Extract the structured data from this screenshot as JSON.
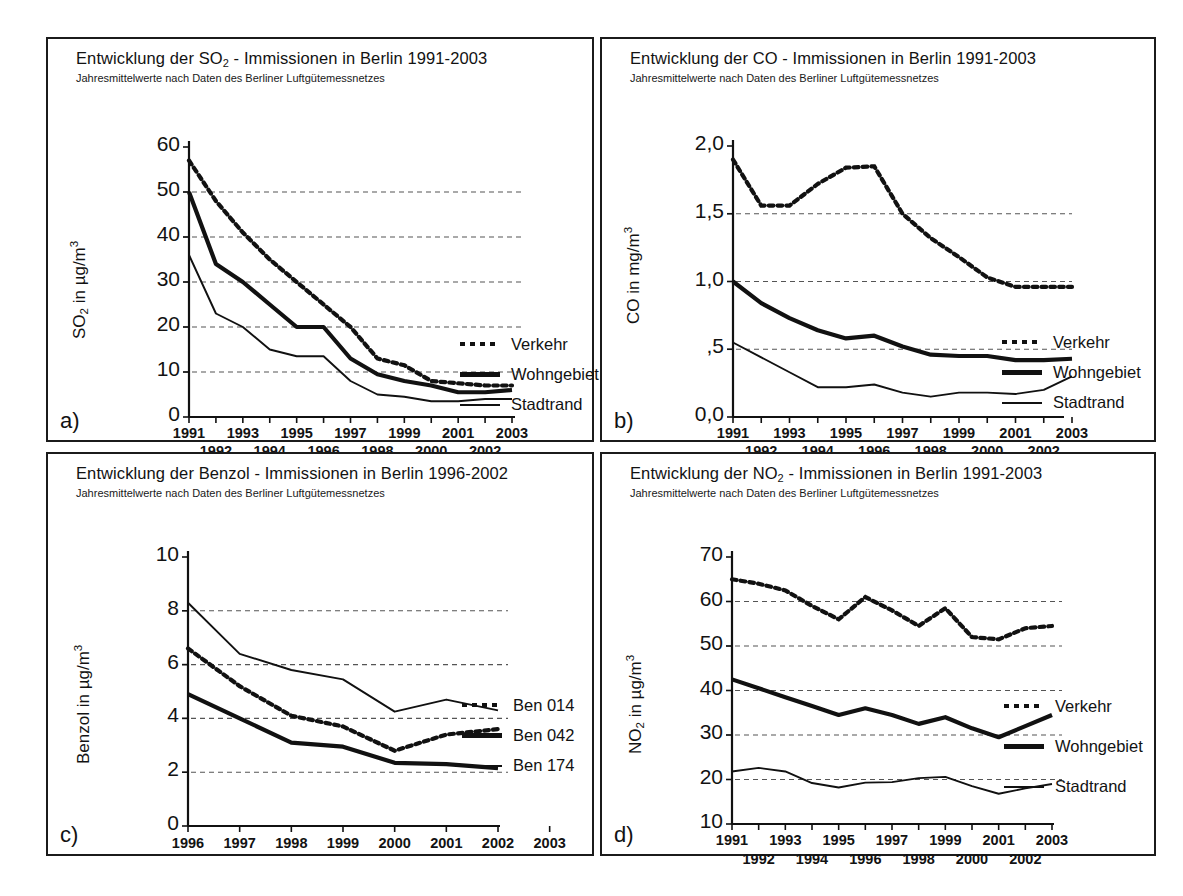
{
  "panels": [
    {
      "key": "a",
      "label": "a)",
      "title_pre": "Entwicklung der SO",
      "title_sub": "2",
      "title_post": " - Immissionen  in Berlin 1991-2003",
      "subtitle": "Jahresmittelwerte nach Daten des Berliner Luftgütemessnetzes",
      "ylabel_pre": "SO",
      "ylabel_sub": "2",
      "ylabel_post": " in µg/m",
      "ylabel_sup": "3",
      "yticks": [
        "0",
        "10",
        "20",
        "30",
        "40",
        "50",
        "60"
      ],
      "xticks_top": [
        "1991",
        "1993",
        "1995",
        "1997",
        "1999",
        "2001",
        "2003"
      ],
      "xticks_bottom": [
        "1992",
        "1994",
        "1996",
        "1998",
        "2000",
        "2002"
      ],
      "legend": [
        {
          "style": "dotted",
          "label": "Verkehr"
        },
        {
          "style": "thick",
          "label": "Wohngebiet"
        },
        {
          "style": "thin",
          "label": "Stadtrand"
        }
      ]
    },
    {
      "key": "b",
      "label": "b)",
      "title_pre": "Entwicklung der CO - Immissionen  in Berlin 1991-2003",
      "title_sub": "",
      "title_post": "",
      "subtitle": "Jahresmittelwerte nach Daten des Berliner Luftgütemessnetzes",
      "ylabel_pre": "CO in mg/m",
      "ylabel_sub": "",
      "ylabel_post": "",
      "ylabel_sup": "3",
      "yticks": [
        "0,0",
        ",5",
        "1,0",
        "1,5",
        "2,0"
      ],
      "xticks_top": [
        "1991",
        "1993",
        "1995",
        "1997",
        "1999",
        "2001",
        "2003"
      ],
      "xticks_bottom": [
        "1992",
        "1994",
        "1996",
        "1998",
        "2000",
        "2002"
      ],
      "legend": [
        {
          "style": "dotted",
          "label": "Verkehr"
        },
        {
          "style": "thick",
          "label": "Wohngebiet"
        },
        {
          "style": "thin",
          "label": "Stadtrand"
        }
      ]
    },
    {
      "key": "c",
      "label": "c)",
      "title_pre": "Entwicklung der Benzol - Immissionen  in Berlin 1996-2002",
      "title_sub": "",
      "title_post": "",
      "subtitle": "Jahresmittelwerte nach Daten des Berliner Luftgütemessnetzes",
      "ylabel_pre": "Benzol in µg/m",
      "ylabel_sub": "",
      "ylabel_post": "",
      "ylabel_sup": "3",
      "yticks": [
        "0",
        "2",
        "4",
        "6",
        "8",
        "10"
      ],
      "xticks_top": [
        "1996",
        "1997",
        "1998",
        "1999",
        "2000",
        "2001",
        "2002",
        "2003"
      ],
      "xticks_bottom": [],
      "legend": [
        {
          "style": "dotted",
          "label": "Ben 014"
        },
        {
          "style": "thick",
          "label": "Ben 042"
        },
        {
          "style": "thin",
          "label": "Ben 174"
        }
      ]
    },
    {
      "key": "d",
      "label": "d)",
      "title_pre": "Entwicklung der NO",
      "title_sub": "2",
      "title_post": " - Immissionen  in Berlin 1991-2003",
      "subtitle": "Jahresmittelwerte nach Daten des Berliner Luftgütemessnetzes",
      "ylabel_pre": "NO",
      "ylabel_sub": "2",
      "ylabel_post": " in µg/m",
      "ylabel_sup": "3",
      "yticks": [
        "10",
        "20",
        "30",
        "40",
        "50",
        "60",
        "70"
      ],
      "xticks_top": [
        "1991",
        "1993",
        "1995",
        "1997",
        "1999",
        "2001",
        "2003"
      ],
      "xticks_bottom": [
        "1992",
        "1994",
        "1996",
        "1998",
        "2000",
        "2002"
      ],
      "legend": [
        {
          "style": "dotted",
          "label": "Verkehr"
        },
        {
          "style": "thick",
          "label": "Wohngebiet"
        },
        {
          "style": "thin",
          "label": "Stadtrand"
        }
      ]
    }
  ],
  "chart_data": [
    {
      "id": "a",
      "type": "line",
      "title": "Entwicklung der SO2 - Immissionen  in Berlin 1991-2003",
      "subtitle": "Jahresmittelwerte nach Daten des Berliner Luftgütemessnetzes",
      "xlabel": "",
      "ylabel": "SO2 in µg/m3",
      "ylim": [
        0,
        60
      ],
      "yticks": [
        0,
        10,
        20,
        30,
        40,
        50,
        60
      ],
      "grid": true,
      "legend_position": "right",
      "x": [
        1991,
        1992,
        1993,
        1994,
        1995,
        1996,
        1997,
        1998,
        1999,
        2000,
        2001,
        2002,
        2003
      ],
      "series": [
        {
          "name": "Verkehr",
          "style": "dotted",
          "values": [
            57,
            48,
            41,
            35,
            30,
            25,
            20,
            13,
            11.5,
            8,
            7.5,
            7,
            7
          ]
        },
        {
          "name": "Wohngebiet",
          "style": "thick",
          "values": [
            50,
            34,
            30,
            25,
            20,
            20,
            13,
            9.5,
            8,
            7,
            5.5,
            5.5,
            6
          ]
        },
        {
          "name": "Stadtrand",
          "style": "thin",
          "values": [
            36,
            23,
            20,
            15,
            13.5,
            13.5,
            8,
            5,
            4.5,
            3.5,
            3.5,
            4,
            4
          ]
        }
      ]
    },
    {
      "id": "b",
      "type": "line",
      "title": "Entwicklung der CO - Immissionen  in Berlin 1991-2003",
      "subtitle": "Jahresmittelwerte nach Daten des Berliner Luftgütemessnetzes",
      "xlabel": "",
      "ylabel": "CO in mg/m3",
      "ylim": [
        0.0,
        2.0
      ],
      "yticks": [
        0.0,
        0.5,
        1.0,
        1.5,
        2.0
      ],
      "grid": true,
      "legend_position": "right",
      "x": [
        1991,
        1992,
        1993,
        1994,
        1995,
        1996,
        1997,
        1998,
        1999,
        2000,
        2001,
        2002,
        2003
      ],
      "series": [
        {
          "name": "Verkehr",
          "style": "dotted",
          "values": [
            1.9,
            1.56,
            1.56,
            1.72,
            1.84,
            1.85,
            1.5,
            1.32,
            1.18,
            1.03,
            0.96,
            0.96,
            0.96
          ]
        },
        {
          "name": "Wohngebiet",
          "style": "thick",
          "values": [
            1.0,
            0.84,
            0.73,
            0.64,
            0.58,
            0.6,
            0.52,
            0.46,
            0.45,
            0.45,
            0.42,
            0.42,
            0.43
          ]
        },
        {
          "name": "Stadtrand",
          "style": "thin",
          "values": [
            0.55,
            0.44,
            0.33,
            0.22,
            0.22,
            0.24,
            0.18,
            0.15,
            0.18,
            0.18,
            0.17,
            0.2,
            0.3
          ]
        }
      ]
    },
    {
      "id": "c",
      "type": "line",
      "title": "Entwicklung der Benzol - Immissionen  in Berlin 1996-2002",
      "subtitle": "Jahresmittelwerte nach Daten des Berliner Luftgütemessnetzes",
      "xlabel": "",
      "ylabel": "Benzol in µg/m3",
      "ylim": [
        0,
        10
      ],
      "yticks": [
        0,
        2,
        4,
        6,
        8,
        10
      ],
      "grid": true,
      "legend_position": "right",
      "x": [
        1996,
        1997,
        1998,
        1999,
        2000,
        2001,
        2002
      ],
      "series": [
        {
          "name": "Ben 014",
          "style": "dotted",
          "values": [
            6.6,
            5.2,
            4.1,
            3.7,
            2.8,
            3.4,
            3.6
          ]
        },
        {
          "name": "Ben 042",
          "style": "thick",
          "values": [
            4.9,
            4.0,
            3.1,
            2.95,
            2.35,
            2.3,
            2.15
          ]
        },
        {
          "name": "Ben 174",
          "style": "thin",
          "values": [
            8.3,
            6.4,
            5.8,
            5.45,
            4.25,
            4.7,
            4.3
          ]
        }
      ]
    },
    {
      "id": "d",
      "type": "line",
      "title": "Entwicklung der NO2 - Immissionen  in Berlin 1991-2003",
      "subtitle": "Jahresmittelwerte nach Daten des Berliner Luftgütemessnetzes",
      "xlabel": "",
      "ylabel": "NO2 in µg/m3",
      "ylim": [
        10,
        70
      ],
      "yticks": [
        10,
        20,
        30,
        40,
        50,
        60,
        70
      ],
      "grid": true,
      "legend_position": "right",
      "x": [
        1991,
        1992,
        1993,
        1994,
        1995,
        1996,
        1997,
        1998,
        1999,
        2000,
        2001,
        2002,
        2003
      ],
      "series": [
        {
          "name": "Verkehr",
          "style": "dotted",
          "values": [
            65,
            64,
            62.5,
            59,
            56,
            61,
            58,
            54.5,
            58.5,
            52,
            51.5,
            54,
            54.5
          ]
        },
        {
          "name": "Wohngebiet",
          "style": "thick",
          "values": [
            42.5,
            40.5,
            38.5,
            36.5,
            34.5,
            36,
            34.5,
            32.5,
            34,
            31.5,
            29.5,
            32,
            34.5
          ]
        },
        {
          "name": "Stadtrand",
          "style": "thin",
          "values": [
            21.8,
            22.6,
            21.8,
            19.2,
            18.2,
            19.3,
            19.4,
            20.3,
            20.6,
            18.5,
            16.8,
            18,
            19
          ]
        }
      ]
    }
  ]
}
